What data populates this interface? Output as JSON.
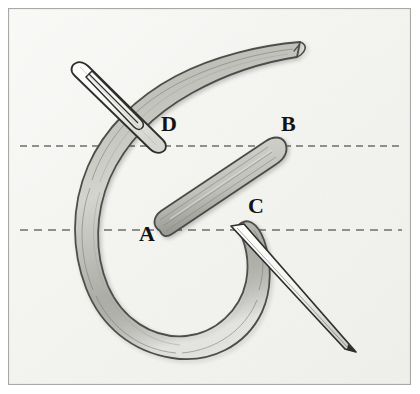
{
  "figure": {
    "width": 420,
    "height": 394,
    "background_color": "#f7f7f5",
    "border_color": "#a8a8a6",
    "paper_tint": "#f2f2ef"
  },
  "labels": [
    {
      "id": "A",
      "text": "A",
      "x": 139,
      "y": 223
    },
    {
      "id": "B",
      "text": "B",
      "x": 281,
      "y": 113
    },
    {
      "id": "C",
      "text": "C",
      "x": 248,
      "y": 195
    },
    {
      "id": "D",
      "text": "D",
      "x": 161,
      "y": 113
    }
  ],
  "guide_lines": [
    {
      "id": "upper",
      "orientation": "horizontal",
      "y": 146,
      "x_start": 20,
      "x_end": 402,
      "style": "dashed",
      "color": "#6e6e6c"
    },
    {
      "id": "lower",
      "orientation": "horizontal",
      "y": 230,
      "x_start": 20,
      "x_end": 402,
      "style": "dashed",
      "color": "#6e6e6c"
    }
  ],
  "thread": {
    "fill_color": "#b7b7b1",
    "outline_color": "#4a4a47",
    "shade_color": "#9a9a94",
    "highlight_color": "#d2d2cc"
  },
  "needle": {
    "fill_color": "#fbfbf9",
    "outline_color": "#2e2e2c",
    "shade_color": "#cfcfc9"
  },
  "stitch": {
    "from": "A",
    "to": "B",
    "fill_color": "#b7b7b1",
    "outline_color": "#4a4a47"
  }
}
